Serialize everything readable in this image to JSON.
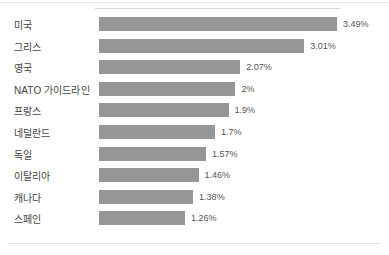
{
  "chart_data": {
    "type": "bar",
    "orientation": "horizontal",
    "title": "",
    "subtitle": "",
    "xlabel": "",
    "ylabel": "",
    "grid": false,
    "legend": null,
    "xlim": [
      0,
      3.49
    ],
    "unit": "%",
    "categories": [
      "미국",
      "그리스",
      "영국",
      "NATO 가이드라인",
      "프랑스",
      "네덜란드",
      "독일",
      "이탈리아",
      "캐나다",
      "스페인"
    ],
    "values": [
      3.49,
      3.01,
      2.07,
      2,
      1.9,
      1.7,
      1.57,
      1.46,
      1.38,
      1.26
    ],
    "value_labels": [
      "3.49%",
      "3.01%",
      "2.07%",
      "2%",
      "1.9%",
      "1.7%",
      "1.57%",
      "1.46%",
      "1.38%",
      "1.26%"
    ]
  },
  "style": {
    "bar_color": "#969696",
    "category_text_color": "#444444",
    "value_text_color": "#555555",
    "rule_color": "#e3e3e3",
    "background": "#ffffff"
  }
}
